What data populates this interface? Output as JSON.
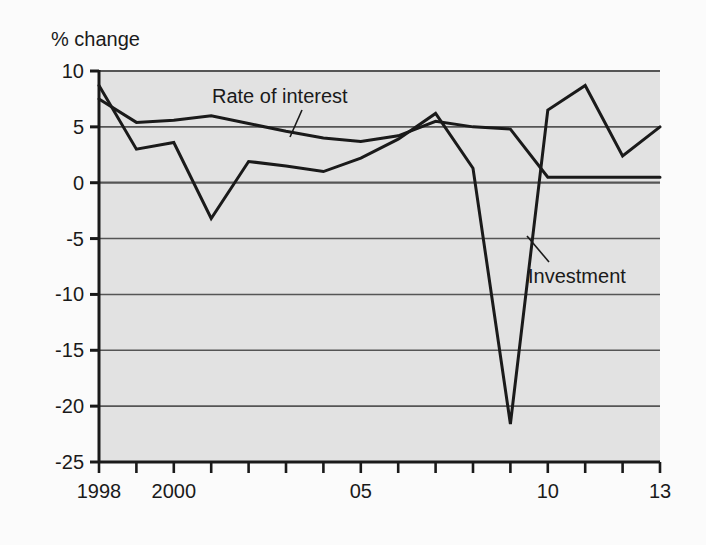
{
  "chart_data": {
    "type": "line",
    "title": "",
    "subtitle": "",
    "ylabel": "% change",
    "xlabel": "",
    "ylim": [
      -25,
      10
    ],
    "xlim": [
      1998,
      2013
    ],
    "grid": true,
    "legend_position": "inline-annotations",
    "y_ticks": [
      10,
      5,
      0,
      -5,
      -10,
      -15,
      -20,
      -25
    ],
    "y_tick_labels": [
      "10",
      "5",
      "0",
      "-5",
      "-10",
      "-15",
      "-20",
      "-25"
    ],
    "x": [
      1998,
      1999,
      2000,
      2001,
      2002,
      2003,
      2004,
      2005,
      2006,
      2007,
      2008,
      2009,
      2010,
      2011,
      2012,
      2013
    ],
    "x_tick_labels": [
      "1998",
      "",
      "2000",
      "",
      "",
      "",
      "",
      "05",
      "",
      "",
      "",
      "",
      "10",
      "",
      "",
      "13"
    ],
    "x_labeled_ticks": [
      {
        "value": 1998,
        "label": "1998"
      },
      {
        "value": 2000,
        "label": "2000"
      },
      {
        "value": 2005,
        "label": "05"
      },
      {
        "value": 2010,
        "label": "10"
      },
      {
        "value": 2013,
        "label": "13"
      }
    ],
    "series": [
      {
        "name": "Rate of interest",
        "color": "#1a1a1a",
        "values": [
          7.5,
          5.4,
          5.6,
          6.0,
          5.3,
          4.6,
          4.0,
          3.7,
          4.2,
          5.5,
          5.0,
          4.8,
          0.5,
          0.5,
          0.5,
          0.5
        ]
      },
      {
        "name": "Investment",
        "color": "#1a1a1a",
        "values": [
          8.7,
          3.0,
          3.6,
          -3.2,
          1.9,
          1.5,
          1.0,
          2.2,
          3.9,
          6.2,
          1.3,
          -21.6,
          6.5,
          8.7,
          2.4,
          5.0
        ]
      }
    ],
    "annotations": [
      {
        "text": "Rate of interest",
        "series": "Rate of interest",
        "text_x": 212,
        "text_y": 103,
        "leader_from_x": 302,
        "leader_from_y": 110,
        "leader_to_x": 290,
        "leader_to_y": 137
      },
      {
        "text": "Investment",
        "series": "Investment",
        "text_x": 528,
        "text_y": 283,
        "leader_from_x": 549,
        "leader_from_y": 262,
        "leader_to_x": 527,
        "leader_to_y": 236
      }
    ],
    "style": {
      "plot_background": "#e2e2e2",
      "gridline_color": "#555555",
      "axis_color": "#1a1a1a",
      "page_background": "#fbfbfb",
      "line_width": 3
    }
  },
  "axis": {
    "y_title": "% change"
  }
}
